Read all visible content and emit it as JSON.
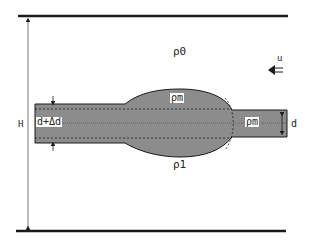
{
  "diagram": {
    "labels": {
      "rho_upper": "ρ0",
      "rho_lower": "ρ1",
      "rho_bulge": "ρm",
      "rho_band": "ρm",
      "height": "H",
      "thickness": "d",
      "thickness_perturbed": "d+Δd",
      "velocity": "u"
    },
    "colors": {
      "fill": "#8c8c8c",
      "line": "#1a1a1a",
      "background": "#ffffff"
    }
  }
}
